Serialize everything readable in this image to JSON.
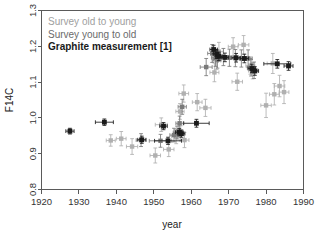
{
  "chart_data": {
    "type": "scatter",
    "title": "",
    "xlabel": "year",
    "ylabel": "F14C",
    "xlim": [
      1920,
      1990
    ],
    "ylim": [
      0.8,
      1.3
    ],
    "xticks": [
      1920,
      1930,
      1940,
      1950,
      1960,
      1970,
      1980,
      1990
    ],
    "yticks": [
      "0.8",
      "0.9",
      "1.0",
      "1.1",
      "1.2",
      "1.3"
    ],
    "grid": false,
    "legend_position": "top-left",
    "legend": [
      {
        "label": "Survey old to young",
        "color": "#a0a0a0"
      },
      {
        "label": "Survey young to old",
        "color": "#6b6b6b"
      },
      {
        "label": "Graphite measurement [1]",
        "color": "#1a1a1a"
      }
    ],
    "series": [
      {
        "name": "Survey old to young",
        "color": "#b0b0b0",
        "marker": "square",
        "points": [
          {
            "x": 1938.5,
            "y": 0.937,
            "xerr": 1.2,
            "yerr": 0.016
          },
          {
            "x": 1941.3,
            "y": 0.942,
            "xerr": 1.3,
            "yerr": 0.02
          },
          {
            "x": 1944.2,
            "y": 0.92,
            "xerr": 1.5,
            "yerr": 0.022
          },
          {
            "x": 1950.4,
            "y": 0.895,
            "xerr": 1.4,
            "yerr": 0.021
          },
          {
            "x": 1952.0,
            "y": 0.981,
            "xerr": 1.6,
            "yerr": 0.019
          },
          {
            "x": 1954.0,
            "y": 0.912,
            "xerr": 1.4,
            "yerr": 0.02
          },
          {
            "x": 1956.0,
            "y": 0.948,
            "xerr": 1.2,
            "yerr": 0.02
          },
          {
            "x": 1956.6,
            "y": 0.963,
            "xerr": 1.0,
            "yerr": 0.018
          },
          {
            "x": 1957.2,
            "y": 0.958,
            "xerr": 1.1,
            "yerr": 0.02
          },
          {
            "x": 1958.2,
            "y": 0.938,
            "xerr": 1.2,
            "yerr": 0.021
          },
          {
            "x": 1957.0,
            "y": 1.018,
            "xerr": 1.1,
            "yerr": 0.022
          },
          {
            "x": 1958.0,
            "y": 1.068,
            "xerr": 1.3,
            "yerr": 0.024
          },
          {
            "x": 1961.6,
            "y": 1.044,
            "xerr": 1.3,
            "yerr": 0.024
          },
          {
            "x": 1963.8,
            "y": 1.028,
            "xerr": 1.5,
            "yerr": 0.024
          },
          {
            "x": 1966.2,
            "y": 1.127,
            "xerr": 1.2,
            "yerr": 0.026
          },
          {
            "x": 1966.8,
            "y": 1.16,
            "xerr": 1.1,
            "yerr": 0.025
          },
          {
            "x": 1967.4,
            "y": 1.185,
            "xerr": 1.2,
            "yerr": 0.026
          },
          {
            "x": 1971.2,
            "y": 1.199,
            "xerr": 1.3,
            "yerr": 0.025
          },
          {
            "x": 1972.3,
            "y": 1.101,
            "xerr": 1.4,
            "yerr": 0.024
          },
          {
            "x": 1974.0,
            "y": 1.204,
            "xerr": 1.4,
            "yerr": 0.026
          },
          {
            "x": 1975.8,
            "y": 1.146,
            "xerr": 1.2,
            "yerr": 0.024
          },
          {
            "x": 1976.4,
            "y": 1.132,
            "xerr": 1.1,
            "yerr": 0.023
          },
          {
            "x": 1980.0,
            "y": 1.035,
            "xerr": 1.4,
            "yerr": 0.034
          },
          {
            "x": 1981.8,
            "y": 1.152,
            "xerr": 1.5,
            "yerr": 0.028
          },
          {
            "x": 1982.2,
            "y": 1.066,
            "xerr": 1.3,
            "yerr": 0.03
          },
          {
            "x": 1983.6,
            "y": 1.089,
            "xerr": 1.4,
            "yerr": 0.03
          },
          {
            "x": 1984.8,
            "y": 1.072,
            "xerr": 1.3,
            "yerr": 0.032
          }
        ]
      },
      {
        "name": "Survey young to old",
        "color": "#7a7a7a",
        "marker": "square",
        "points": [
          {
            "x": 1946.6,
            "y": 0.938,
            "xerr": 1.3,
            "yerr": 0.018
          },
          {
            "x": 1951.8,
            "y": 0.936,
            "xerr": 3.0,
            "yerr": 0.018
          },
          {
            "x": 1955.4,
            "y": 0.952,
            "xerr": 1.1,
            "yerr": 0.019
          },
          {
            "x": 1956.2,
            "y": 0.959,
            "xerr": 1.0,
            "yerr": 0.018
          },
          {
            "x": 1956.9,
            "y": 0.985,
            "xerr": 1.0,
            "yerr": 0.02
          },
          {
            "x": 1957.6,
            "y": 1.031,
            "xerr": 1.1,
            "yerr": 0.021
          },
          {
            "x": 1964.0,
            "y": 1.142,
            "xerr": 1.6,
            "yerr": 0.024
          },
          {
            "x": 1965.6,
            "y": 1.18,
            "xerr": 1.2,
            "yerr": 0.025
          },
          {
            "x": 1966.5,
            "y": 1.168,
            "xerr": 1.1,
            "yerr": 0.024
          },
          {
            "x": 1967.0,
            "y": 1.163,
            "xerr": 1.0,
            "yerr": 0.024
          },
          {
            "x": 1968.6,
            "y": 1.17,
            "xerr": 1.2,
            "yerr": 0.024
          },
          {
            "x": 1970.2,
            "y": 1.168,
            "xerr": 1.2,
            "yerr": 0.024
          },
          {
            "x": 1971.8,
            "y": 1.167,
            "xerr": 1.2,
            "yerr": 0.024
          },
          {
            "x": 1973.4,
            "y": 1.166,
            "xerr": 1.2,
            "yerr": 0.024
          },
          {
            "x": 1975.2,
            "y": 1.166,
            "xerr": 1.1,
            "yerr": 0.024
          },
          {
            "x": 1976.0,
            "y": 1.14,
            "xerr": 1.0,
            "yerr": 0.023
          },
          {
            "x": 1976.8,
            "y": 1.133,
            "xerr": 1.0,
            "yerr": 0.023
          }
        ]
      },
      {
        "name": "Graphite measurement [1]",
        "color": "#1a1a1a",
        "marker": "square",
        "points": [
          {
            "x": 1927.6,
            "y": 0.963,
            "xerr": 1.1,
            "yerr": 0.008
          },
          {
            "x": 1936.8,
            "y": 0.988,
            "xerr": 2.4,
            "yerr": 0.009
          },
          {
            "x": 1946.8,
            "y": 0.939,
            "xerr": 1.1,
            "yerr": 0.01
          },
          {
            "x": 1952.6,
            "y": 0.977,
            "xerr": 1.0,
            "yerr": 0.01
          },
          {
            "x": 1953.8,
            "y": 0.936,
            "xerr": 3.6,
            "yerr": 0.01
          },
          {
            "x": 1956.8,
            "y": 0.96,
            "xerr": 1.0,
            "yerr": 0.01
          },
          {
            "x": 1957.4,
            "y": 0.956,
            "xerr": 0.9,
            "yerr": 0.01
          },
          {
            "x": 1961.4,
            "y": 0.985,
            "xerr": 3.4,
            "yerr": 0.011
          },
          {
            "x": 1966.0,
            "y": 1.191,
            "xerr": 1.0,
            "yerr": 0.012
          },
          {
            "x": 1966.8,
            "y": 1.178,
            "xerr": 0.9,
            "yerr": 0.012
          },
          {
            "x": 1967.4,
            "y": 1.172,
            "xerr": 0.9,
            "yerr": 0.012
          },
          {
            "x": 1969.0,
            "y": 1.169,
            "xerr": 1.0,
            "yerr": 0.012
          },
          {
            "x": 1972.0,
            "y": 1.168,
            "xerr": 1.1,
            "yerr": 0.012
          },
          {
            "x": 1974.2,
            "y": 1.166,
            "xerr": 1.1,
            "yerr": 0.012
          },
          {
            "x": 1976.2,
            "y": 1.138,
            "xerr": 1.0,
            "yerr": 0.012
          },
          {
            "x": 1977.0,
            "y": 1.131,
            "xerr": 1.0,
            "yerr": 0.012
          },
          {
            "x": 1983.0,
            "y": 1.151,
            "xerr": 3.6,
            "yerr": 0.012
          },
          {
            "x": 1986.0,
            "y": 1.145,
            "xerr": 1.2,
            "yerr": 0.012
          }
        ]
      }
    ]
  }
}
